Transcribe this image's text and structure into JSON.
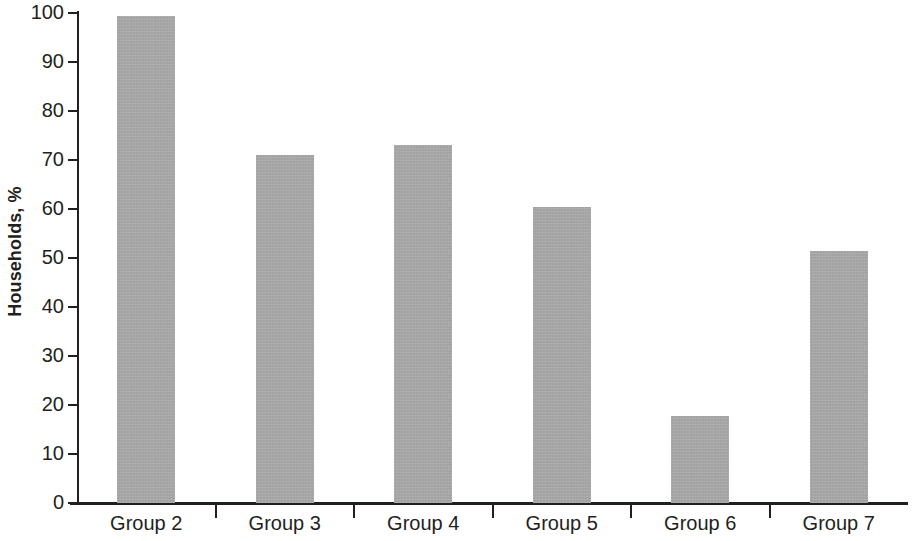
{
  "chart_data": {
    "type": "bar",
    "title": "",
    "xlabel": "",
    "ylabel": "Households, %",
    "categories": [
      "Group 2",
      "Group 3",
      "Group 4",
      "Group 5",
      "Group 6",
      "Group 7"
    ],
    "values": [
      99.3,
      71.0,
      73.0,
      60.5,
      17.8,
      51.5
    ],
    "ylim": [
      0,
      100
    ],
    "ytick_labels": [
      "100",
      "90",
      "80",
      "70",
      "60",
      "50",
      "40",
      "30",
      "20",
      "10",
      "0"
    ],
    "ytick_values": [
      100,
      90,
      80,
      70,
      60,
      50,
      40,
      30,
      20,
      10,
      0
    ],
    "grid": false,
    "legend": null,
    "bar_color": "#aaaaaa",
    "axis_color": "#231f20",
    "background_color": "#ffffff"
  }
}
